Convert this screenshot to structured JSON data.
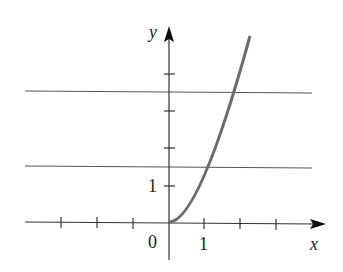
{
  "figure": {
    "type": "function-graph",
    "axes": {
      "x_label": "x",
      "y_label": "y",
      "origin_label": "0",
      "x_tick_label": "1",
      "y_tick_label": "1",
      "x_ticks": [
        -3,
        -2,
        -1,
        1,
        2,
        3
      ],
      "y_ticks": [
        1,
        2,
        3,
        4
      ]
    },
    "curve": {
      "expression": "y = x^2",
      "domain": [
        0,
        2.25
      ],
      "color": "#666666"
    },
    "horizontal_lines": [
      {
        "y": 1.5,
        "color": "#555555"
      },
      {
        "y": 3.5,
        "color": "#555555"
      }
    ]
  }
}
